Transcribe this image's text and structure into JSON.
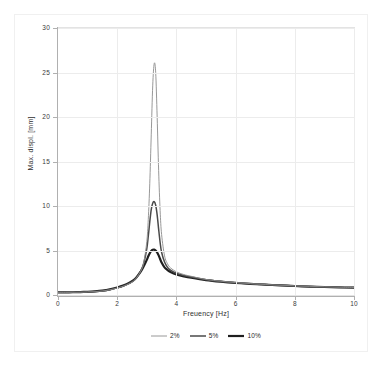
{
  "chart_data": {
    "type": "line",
    "title": "",
    "xlabel": "Freuency [Hz]",
    "ylabel": "Max. displ. [mm]",
    "xlim": [
      0,
      10
    ],
    "ylim": [
      0,
      30
    ],
    "xticks": [
      "0",
      "2",
      "4",
      "6",
      "8",
      "10"
    ],
    "yticks": [
      "0",
      "5",
      "10",
      "15",
      "20",
      "25",
      "30"
    ],
    "xtick_values": [
      0,
      2,
      4,
      6,
      8,
      10
    ],
    "ytick_values": [
      0,
      5,
      10,
      15,
      20,
      25,
      30
    ],
    "grid": true,
    "legend_position": "bottom-center",
    "legend": [
      "2%",
      "5%",
      "10%"
    ],
    "peak_frequency_hz": 3.3,
    "series": [
      {
        "name": "2%",
        "color": "#8c8c8c",
        "line_width": 0.9,
        "peak_value": 26.0,
        "x": [
          0.0,
          0.25,
          0.5,
          0.75,
          1.0,
          1.25,
          1.5,
          1.75,
          2.0,
          2.2,
          2.4,
          2.6,
          2.8,
          2.9,
          3.0,
          3.05,
          3.1,
          3.15,
          3.2,
          3.25,
          3.3,
          3.35,
          3.4,
          3.45,
          3.5,
          3.6,
          3.7,
          3.8,
          4.0,
          4.25,
          4.5,
          5.0,
          5.5,
          6.0,
          6.5,
          7.0,
          7.5,
          8.0,
          8.5,
          9.0,
          9.5,
          10.0
        ],
        "y": [
          0.3,
          0.3,
          0.31,
          0.32,
          0.34,
          0.38,
          0.45,
          0.58,
          0.78,
          0.98,
          1.25,
          1.7,
          2.7,
          3.7,
          6.0,
          8.5,
          12.5,
          18.0,
          23.5,
          26.0,
          25.0,
          20.0,
          14.0,
          9.5,
          6.8,
          4.4,
          3.5,
          3.05,
          2.6,
          2.3,
          2.1,
          1.75,
          1.55,
          1.4,
          1.28,
          1.18,
          1.1,
          1.03,
          0.97,
          0.92,
          0.88,
          0.84
        ]
      },
      {
        "name": "5%",
        "color": "#4a4a4a",
        "line_width": 1.5,
        "peak_value": 10.5,
        "x": [
          0.0,
          0.25,
          0.5,
          0.75,
          1.0,
          1.25,
          1.5,
          1.75,
          2.0,
          2.2,
          2.4,
          2.6,
          2.8,
          2.9,
          3.0,
          3.05,
          3.1,
          3.15,
          3.2,
          3.25,
          3.3,
          3.35,
          3.4,
          3.45,
          3.5,
          3.6,
          3.7,
          3.8,
          4.0,
          4.25,
          4.5,
          5.0,
          5.5,
          6.0,
          6.5,
          7.0,
          7.5,
          8.0,
          8.5,
          9.0,
          9.5,
          10.0
        ],
        "y": [
          0.3,
          0.3,
          0.31,
          0.32,
          0.35,
          0.39,
          0.46,
          0.6,
          0.8,
          1.0,
          1.3,
          1.75,
          2.75,
          3.6,
          5.2,
          6.6,
          8.2,
          9.6,
          10.3,
          10.5,
          10.1,
          9.0,
          7.4,
          5.9,
          4.8,
          3.7,
          3.1,
          2.8,
          2.45,
          2.2,
          2.02,
          1.72,
          1.52,
          1.38,
          1.26,
          1.17,
          1.09,
          1.02,
          0.96,
          0.91,
          0.87,
          0.83
        ]
      },
      {
        "name": "10%",
        "color": "#1f1f1f",
        "line_width": 2.2,
        "peak_value": 5.1,
        "x": [
          0.0,
          0.25,
          0.5,
          0.75,
          1.0,
          1.25,
          1.5,
          1.75,
          2.0,
          2.2,
          2.4,
          2.6,
          2.8,
          2.9,
          3.0,
          3.05,
          3.1,
          3.15,
          3.2,
          3.25,
          3.3,
          3.35,
          3.4,
          3.45,
          3.5,
          3.6,
          3.7,
          3.8,
          4.0,
          4.25,
          4.5,
          5.0,
          5.5,
          6.0,
          6.5,
          7.0,
          7.5,
          8.0,
          8.5,
          9.0,
          9.5,
          10.0
        ],
        "y": [
          0.3,
          0.3,
          0.31,
          0.33,
          0.36,
          0.41,
          0.49,
          0.63,
          0.84,
          1.05,
          1.35,
          1.8,
          2.65,
          3.25,
          3.95,
          4.35,
          4.7,
          4.95,
          5.08,
          5.1,
          5.0,
          4.78,
          4.45,
          4.05,
          3.65,
          3.1,
          2.8,
          2.58,
          2.3,
          2.1,
          1.94,
          1.68,
          1.5,
          1.36,
          1.25,
          1.16,
          1.08,
          1.01,
          0.95,
          0.9,
          0.86,
          0.82
        ]
      }
    ]
  }
}
